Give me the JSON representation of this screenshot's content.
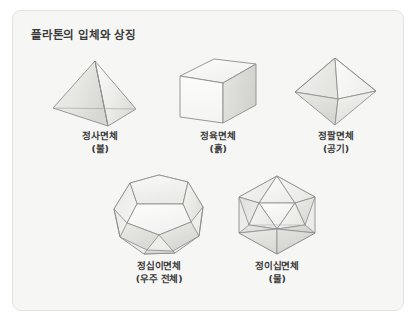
{
  "card": {
    "title": "플라톤의 입체와 상징",
    "background_color": "#f6f6f4",
    "border_color": "#e2e2de",
    "title_color": "#3b3b3b"
  },
  "style": {
    "stroke_color": "#8d8d8d",
    "face_light": "#fbfbfa",
    "face_mid": "#ededea",
    "face_dark": "#d9d9d5",
    "face_darker": "#cfcfca",
    "caption_color": "#3a3a3a"
  },
  "solids": [
    {
      "id": "tetrahedron",
      "icon": "tetrahedron-icon",
      "name": "정사면체",
      "element": "(불)",
      "faces": 4
    },
    {
      "id": "cube",
      "icon": "cube-icon",
      "name": "정육면체",
      "element": "(흙)",
      "faces": 6
    },
    {
      "id": "octahedron",
      "icon": "octahedron-icon",
      "name": "정팔면체",
      "element": "(공기)",
      "faces": 8
    },
    {
      "id": "dodecahedron",
      "icon": "dodecahedron-icon",
      "name": "정십이면체",
      "element": "(우주 전체)",
      "faces": 12
    },
    {
      "id": "icosahedron",
      "icon": "icosahedron-icon",
      "name": "정이십면체",
      "element": "(물)",
      "faces": 20
    }
  ]
}
